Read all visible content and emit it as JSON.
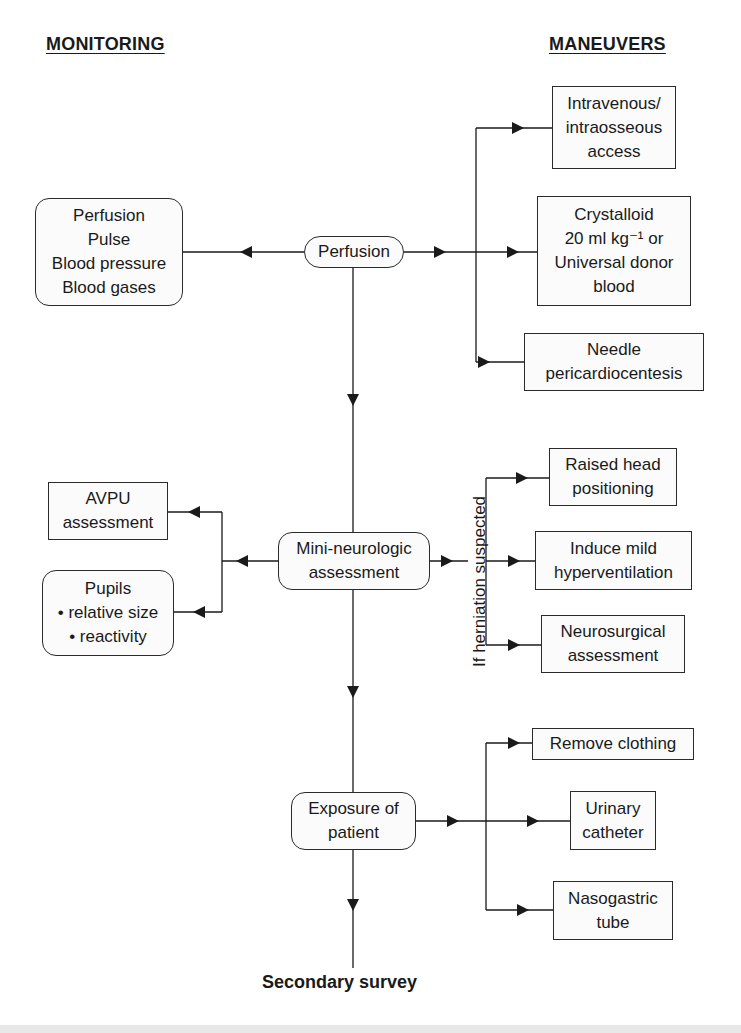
{
  "headings": {
    "monitoring": "MONITORING",
    "maneuvers": "MANEUVERS"
  },
  "nodes": {
    "perfusion": "Perfusion",
    "mini_neuro": "Mini-neurologic\nassessment",
    "exposure": "Exposure of\npatient",
    "secondary_survey": "Secondary survey"
  },
  "monitoring": {
    "perfusion_box": "Perfusion\nPulse\nBlood pressure\nBlood gases",
    "avpu_box": "AVPU\nassessment",
    "pupils_box": "Pupils\n• relative size\n• reactivity"
  },
  "maneuvers": {
    "perfusion": [
      "Intravenous/\nintraosseous\naccess",
      "Crystalloid\n20 ml kg⁻¹ or\nUniversal donor\nblood",
      "Needle\npericardiocentesis"
    ],
    "neuro_condition": "If herniation suspected",
    "neuro": [
      "Raised head\npositioning",
      "Induce mild\nhyperventilation",
      "Neurosurgical\nassessment"
    ],
    "exposure": [
      "Remove clothing",
      "Urinary\ncatheter",
      "Nasogastric\ntube"
    ]
  },
  "colors": {
    "line": "#1a1a1a",
    "box_border": "#2a2a2a",
    "box_fill": "#fbfbfb"
  }
}
